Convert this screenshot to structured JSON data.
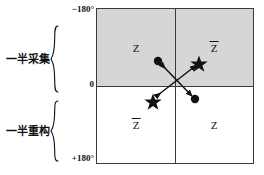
{
  "figure": {
    "name": "half-acquisition-half-reconstruction-phase-diagram",
    "side_labels": [
      {
        "id": "acquire",
        "text": "一半采集",
        "brace": "{"
      },
      {
        "id": "recon",
        "text": "一半重构",
        "brace": "{"
      }
    ],
    "axis_labels": {
      "top": "−180°",
      "middle": "0",
      "bottom": "+180°"
    },
    "quadrants": [
      {
        "id": "top-left",
        "symbol": "Z",
        "overbar": false,
        "shaded": true
      },
      {
        "id": "top-right",
        "symbol": "Z",
        "overbar": true,
        "shaded": true
      },
      {
        "id": "bottom-left",
        "symbol": "Z",
        "overbar": true,
        "shaded": false
      },
      {
        "id": "bottom-right",
        "symbol": "Z",
        "overbar": false,
        "shaded": false
      }
    ],
    "markers": [
      {
        "id": "circle-upper-left",
        "shape": "circle",
        "x": 61,
        "y": 52
      },
      {
        "id": "star-upper-right",
        "shape": "star",
        "x": 102,
        "y": 53
      },
      {
        "id": "star-lower-left",
        "shape": "star",
        "x": 56,
        "y": 91
      },
      {
        "id": "circle-lower-right",
        "shape": "circle",
        "x": 98,
        "y": 90
      }
    ],
    "arrows": [
      {
        "id": "arrow-circle-pair",
        "from": "circle-upper-left",
        "to": "circle-lower-right",
        "double_headed": true
      },
      {
        "id": "arrow-star-pair",
        "from": "star-lower-left",
        "to": "star-upper-right",
        "double_headed": true
      }
    ],
    "colors": {
      "shaded_half": "#d6d6d6",
      "unshaded_half": "#ffffff",
      "frame": "#3b3b3b",
      "marker": "#111111",
      "text": "#111111"
    }
  }
}
